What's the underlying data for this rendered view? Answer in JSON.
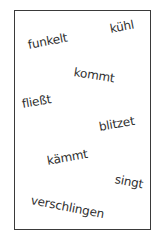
{
  "card": {
    "border_color": "#3a3a3a",
    "words": [
      {
        "text": "funkelt",
        "x": 28,
        "y": 39,
        "rotate": -11
      },
      {
        "text": "kühl",
        "x": 110,
        "y": 23,
        "rotate": -11
      },
      {
        "text": "kommt",
        "x": 74,
        "y": 69,
        "rotate": 9
      },
      {
        "text": "fließt",
        "x": 22,
        "y": 97,
        "rotate": -10
      },
      {
        "text": "blitzet",
        "x": 99,
        "y": 121,
        "rotate": -10
      },
      {
        "text": "kämmt",
        "x": 47,
        "y": 154,
        "rotate": -10
      },
      {
        "text": "singt",
        "x": 115,
        "y": 176,
        "rotate": 11
      },
      {
        "text": "verschlingen",
        "x": 32,
        "y": 197,
        "rotate": 11
      }
    ]
  }
}
